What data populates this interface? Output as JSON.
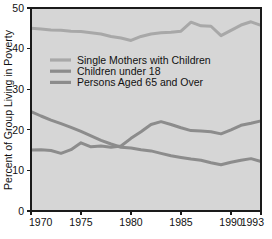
{
  "chart_data": {
    "type": "line",
    "title": "",
    "xlabel": "",
    "ylabel": "Percent of Group Living in Poverty",
    "xlim": [
      1970,
      1993
    ],
    "ylim": [
      0,
      50
    ],
    "grid": false,
    "legend_position": "upper-left-inside",
    "background_color": "#d6d6d6",
    "x": [
      1970,
      1971,
      1972,
      1973,
      1974,
      1975,
      1976,
      1977,
      1978,
      1979,
      1980,
      1981,
      1982,
      1983,
      1984,
      1985,
      1986,
      1987,
      1988,
      1989,
      1990,
      1991,
      1992,
      1993
    ],
    "xticks": [
      1970,
      1975,
      1980,
      1985,
      1990,
      1993
    ],
    "xtick_labels": [
      "1970",
      "1975",
      "1980",
      "1985",
      "1990",
      "1993"
    ],
    "yticks": [
      0,
      10,
      20,
      30,
      40,
      50
    ],
    "ytick_labels": [
      "0",
      "10",
      "20",
      "30",
      "40",
      "50"
    ],
    "series": [
      {
        "name": "Single Mothers with Children",
        "color": "#a8a8a8",
        "stroke_width": 3.0,
        "values": [
          45.0,
          44.8,
          44.6,
          44.5,
          44.3,
          44.2,
          43.9,
          43.6,
          43.0,
          42.6,
          42.0,
          43.0,
          43.6,
          43.9,
          44.0,
          44.3,
          46.5,
          45.6,
          45.5,
          43.2,
          44.5,
          45.8,
          46.6,
          45.7
        ]
      },
      {
        "name": "Children under 18",
        "color": "#8c8c8c",
        "stroke_width": 3.0,
        "values": [
          15.0,
          15.1,
          14.9,
          14.2,
          15.1,
          16.8,
          15.8,
          16.0,
          15.7,
          16.0,
          17.9,
          19.5,
          21.3,
          22.0,
          21.3,
          20.5,
          19.8,
          19.7,
          19.5,
          19.0,
          20.0,
          21.1,
          21.6,
          22.2
        ]
      },
      {
        "name": "Persons Aged 65 and Over",
        "color": "#8c8c8c",
        "stroke_width": 3.0,
        "values": [
          24.5,
          23.4,
          22.4,
          21.5,
          20.6,
          19.6,
          18.5,
          17.4,
          16.5,
          15.7,
          15.5,
          15.1,
          14.8,
          14.2,
          13.6,
          13.2,
          12.8,
          12.5,
          11.9,
          11.4,
          12.0,
          12.5,
          12.9,
          12.2
        ]
      }
    ],
    "legend": [
      {
        "label": "Single Mothers with Children",
        "color": "#a8a8a8"
      },
      {
        "label": "Children under 18",
        "color": "#8c8c8c"
      },
      {
        "label": "Persons Aged 65 and Over",
        "color": "#8c8c8c"
      }
    ]
  }
}
